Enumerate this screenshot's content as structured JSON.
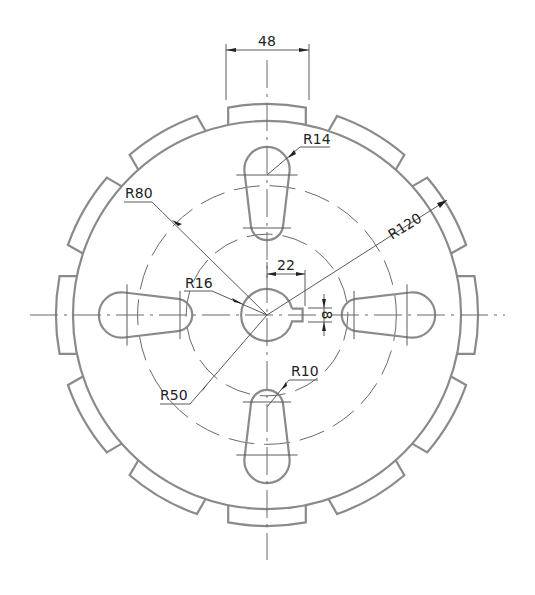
{
  "drawing": {
    "type": "mechanical part drawing - slotted gear disc",
    "stroke_color": "#8a8a8a",
    "text_color": "#222222",
    "center": [
      267,
      315
    ],
    "scale_px_per_unit": 1.617,
    "outer_radius_units": 120,
    "tooth_count": 12,
    "tooth_width_units": 48,
    "slot_count": 4
  },
  "dimensions": {
    "tooth_width": "48",
    "slot_big_end": "R14",
    "bolt_circle_outer": "R80",
    "hub_bore": "R16",
    "outer_radius": "R120",
    "keyway_depth": "22",
    "keyway_width": "8",
    "slot_small_end": "R10",
    "bolt_circle_inner": "R50"
  }
}
